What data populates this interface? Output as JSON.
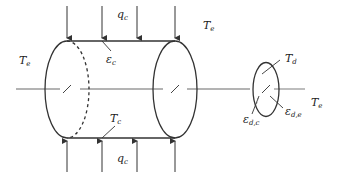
{
  "diagram": {
    "labels": {
      "q_top": {
        "main": "q",
        "sub": "c"
      },
      "q_bottom": {
        "main": "q",
        "sub": "c"
      },
      "te_left": {
        "main": "T",
        "sub": "e"
      },
      "te_top": {
        "main": "T",
        "sub": "e"
      },
      "te_right": {
        "main": "T",
        "sub": "e"
      },
      "eps_c": {
        "main": "ε",
        "sub": "c"
      },
      "tc": {
        "main": "T",
        "sub": "c"
      },
      "td": {
        "main": "T",
        "sub": "d"
      },
      "eps_dc": {
        "main": "ε",
        "sub": "d,c"
      },
      "eps_de": {
        "main": "ε",
        "sub": "d,e"
      }
    },
    "colors": {
      "stroke": "#333333",
      "axis": "#999999",
      "text": "#222222"
    }
  }
}
